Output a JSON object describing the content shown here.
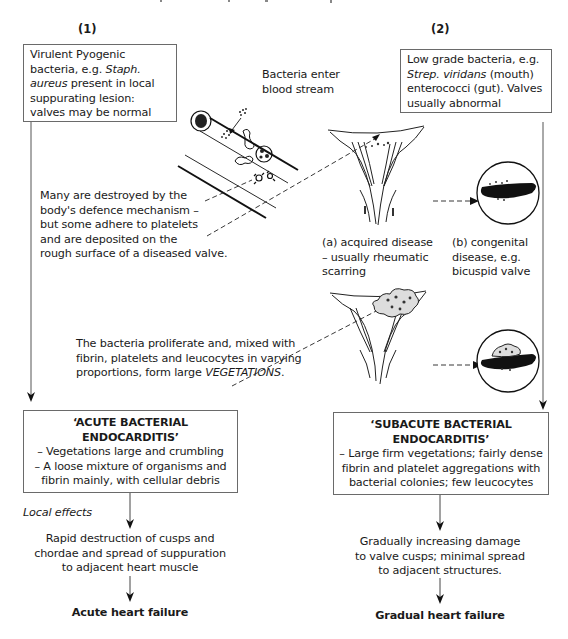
{
  "columns": {
    "left_label": "(1)",
    "right_label": "(2)"
  },
  "left_source_box": {
    "line1": "Virulent Pyogenic",
    "line2_a": "bacteria, e.g. ",
    "line2_b": "Staph.",
    "line3_a": "aureus",
    "line3_b": " present in local",
    "line4": "suppurating lesion:",
    "line5": "valves may be normal"
  },
  "right_source_box": {
    "line1": "Low grade bacteria, e.g.",
    "line2_a": "Strep. viridans",
    "line2_b": " (mouth)",
    "line3": "enterococci (gut). Valves",
    "line4": "usually abnormal"
  },
  "bloodstream_label": {
    "line1": "Bacteria enter",
    "line2": "blood stream"
  },
  "defence_text": {
    "line1": "Many are destroyed by the",
    "line2": "body's defence mechanism –",
    "line3": "but some adhere to platelets",
    "line4": "and are deposited on the",
    "line5": "rough surface of a diseased valve."
  },
  "valve_captions": {
    "acquired": {
      "line1": "(a) acquired disease",
      "line2": "– usually rheumatic",
      "line3": "scarring"
    },
    "congenital": {
      "line1": "(b) congenital",
      "line2": "disease, e.g.",
      "line3": "bicuspid valve"
    }
  },
  "proliferate_text": {
    "line1": "The bacteria proliferate and, mixed with",
    "line2": "fibrin, platelets and leucocytes in varying",
    "line3_a": "proportions, form large ",
    "line3_b": "VEGETATIONS",
    "line3_c": "."
  },
  "acute_box": {
    "title1": "‘ACUTE BACTERIAL",
    "title2": "ENDOCARDITIS’",
    "line1": "– Vegetations large and crumbling",
    "line2": "– A loose mixture of organisms and",
    "line3": "fibrin mainly, with cellular debris"
  },
  "subacute_box": {
    "title1": "‘SUBACUTE BACTERIAL",
    "title2": "ENDOCARDITIS’",
    "line1": "– Large firm vegetations; fairly dense",
    "line2": "fibrin and platelet aggregations with",
    "line3": "bacterial colonies; few leucocytes"
  },
  "local_effects_label": "Local effects",
  "acute_outcome": {
    "line1": "Rapid destruction of cusps and",
    "line2": "chordae and spread of suppuration",
    "line3": "to adjacent heart muscle",
    "result": "Acute heart failure"
  },
  "subacute_outcome": {
    "line1": "Gradually increasing damage",
    "line2": "to valve cusps; minimal spread",
    "line3": "to adjacent structures.",
    "result": "Gradual heart failure"
  },
  "colors": {
    "line": "#555555",
    "ink": "#1a1a1a",
    "box_border": "#6a6a6a"
  }
}
